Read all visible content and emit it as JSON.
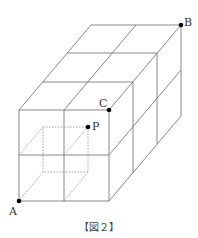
{
  "figure": {
    "caption": "【図２】",
    "colors": {
      "line": "#7a7a7a",
      "dotted": "#8a8a8a",
      "point": "#000000"
    }
  },
  "points": {
    "A": {
      "label": "A"
    },
    "B": {
      "label": "B"
    },
    "C": {
      "label": "C"
    },
    "P": {
      "label": "P"
    }
  }
}
